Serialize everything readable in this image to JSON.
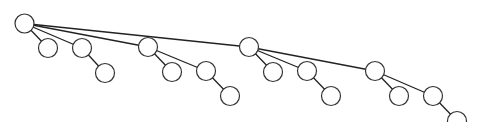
{
  "diagram": {
    "type": "tree",
    "width": 482,
    "height": 122,
    "node_radius": 9.5,
    "colors": {
      "background": "#ffffff",
      "node_fill": "#ffffff",
      "node_stroke": "#333333",
      "edge": "#222222"
    },
    "nodes": [
      {
        "id": "n0",
        "x": 24.5,
        "y": 23.5
      },
      {
        "id": "n1",
        "x": 48,
        "y": 48
      },
      {
        "id": "n2",
        "x": 82,
        "y": 48
      },
      {
        "id": "n3",
        "x": 105,
        "y": 73
      },
      {
        "id": "n4",
        "x": 148,
        "y": 47
      },
      {
        "id": "n5",
        "x": 172,
        "y": 72
      },
      {
        "id": "n6",
        "x": 206,
        "y": 71
      },
      {
        "id": "n7",
        "x": 230,
        "y": 96
      },
      {
        "id": "n8",
        "x": 249,
        "y": 47
      },
      {
        "id": "n9",
        "x": 273,
        "y": 72
      },
      {
        "id": "n10",
        "x": 307,
        "y": 71
      },
      {
        "id": "n11",
        "x": 331,
        "y": 96
      },
      {
        "id": "n12",
        "x": 375,
        "y": 71
      },
      {
        "id": "n13",
        "x": 399,
        "y": 96
      },
      {
        "id": "n14",
        "x": 433,
        "y": 96
      },
      {
        "id": "n15",
        "x": 457,
        "y": 121
      }
    ],
    "edges": [
      {
        "from": "n0",
        "to": "n1"
      },
      {
        "from": "n0",
        "to": "n2"
      },
      {
        "from": "n0",
        "to": "n4"
      },
      {
        "from": "n0",
        "to": "n8"
      },
      {
        "from": "n2",
        "to": "n3"
      },
      {
        "from": "n4",
        "to": "n5"
      },
      {
        "from": "n4",
        "to": "n6"
      },
      {
        "from": "n6",
        "to": "n7"
      },
      {
        "from": "n8",
        "to": "n9"
      },
      {
        "from": "n8",
        "to": "n10"
      },
      {
        "from": "n8",
        "to": "n12"
      },
      {
        "from": "n10",
        "to": "n11"
      },
      {
        "from": "n12",
        "to": "n13"
      },
      {
        "from": "n12",
        "to": "n14"
      },
      {
        "from": "n14",
        "to": "n15"
      }
    ]
  }
}
